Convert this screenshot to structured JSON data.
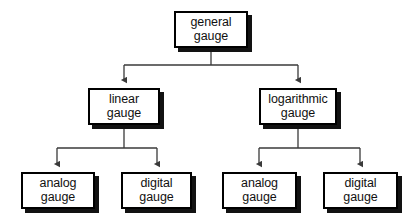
{
  "diagram": {
    "type": "tree",
    "orientation": "top-down",
    "canvas": {
      "width": 415,
      "height": 222,
      "background": "#ffffff"
    },
    "style": {
      "box_fill": "#ffffff",
      "box_border": "#000000",
      "box_shadow": "#121212",
      "edge_color": "#3a3a3a",
      "text_color": "#111111"
    },
    "levels": 3,
    "nodes": [
      {
        "id": "general-gauge",
        "line1": "general",
        "line2": "gauge",
        "level": 0,
        "x": 174,
        "y": 11,
        "w": 74,
        "h": 37
      },
      {
        "id": "linear-gauge",
        "line1": "linear",
        "line2": "gauge",
        "level": 1,
        "x": 88,
        "y": 88,
        "w": 72,
        "h": 37
      },
      {
        "id": "logarithmic-gauge",
        "line1": "logarithmic",
        "line2": "gauge",
        "level": 1,
        "x": 259,
        "y": 88,
        "w": 78,
        "h": 37
      },
      {
        "id": "linear-analog-gauge",
        "line1": "analog",
        "line2": "gauge",
        "level": 2,
        "x": 21,
        "y": 172,
        "w": 74,
        "h": 37
      },
      {
        "id": "linear-digital-gauge",
        "line1": "digital",
        "line2": "gauge",
        "level": 2,
        "x": 121,
        "y": 172,
        "w": 71,
        "h": 37
      },
      {
        "id": "logarithmic-analog-gauge",
        "line1": "analog",
        "line2": "gauge",
        "level": 2,
        "x": 222,
        "y": 172,
        "w": 75,
        "h": 37
      },
      {
        "id": "logarithmic-digital-gauge",
        "line1": "digital",
        "line2": "gauge",
        "level": 2,
        "x": 323,
        "y": 172,
        "w": 75,
        "h": 37
      }
    ],
    "edges": [
      {
        "from": "general-gauge",
        "to": "linear-gauge",
        "arrow": true
      },
      {
        "from": "general-gauge",
        "to": "logarithmic-gauge",
        "arrow": true
      },
      {
        "from": "linear-gauge",
        "to": "linear-analog-gauge",
        "arrow": true
      },
      {
        "from": "linear-gauge",
        "to": "linear-digital-gauge",
        "arrow": true
      },
      {
        "from": "logarithmic-gauge",
        "to": "logarithmic-analog-gauge",
        "arrow": true
      },
      {
        "from": "logarithmic-gauge",
        "to": "logarithmic-digital-gauge",
        "arrow": true
      }
    ]
  }
}
